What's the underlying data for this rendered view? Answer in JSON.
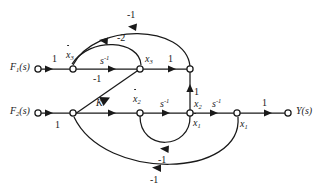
{
  "diagram": {
    "type": "signal-flow-graph",
    "stroke_color": "#1a1a1a",
    "background_color": "#ffffff",
    "inputs": [
      {
        "id": "f1",
        "label": "F",
        "subscript": "1",
        "suffix": "(s)"
      },
      {
        "id": "f2",
        "label": "F",
        "subscript": "2",
        "suffix": "(s)"
      }
    ],
    "output": {
      "id": "y",
      "label": "Y",
      "suffix": "(s)"
    },
    "node_labels": {
      "x3dot": {
        "base": "x",
        "sub": "3",
        "dot": true
      },
      "x3": {
        "base": "x",
        "sub": "3",
        "dot": false
      },
      "x2dot": {
        "base": "x",
        "sub": "2",
        "dot": true
      },
      "x2": {
        "base": "x",
        "sub": "2",
        "dot": false
      },
      "x1dot": {
        "base": "x",
        "sub": "1",
        "dot": true
      },
      "x1": {
        "base": "x",
        "sub": "1",
        "dot": false
      }
    },
    "edge_gains": {
      "f1_to_x3dot": "1",
      "x3dot_to_x3": "s",
      "x3dot_to_x3_exp": "-1",
      "x3_to_sum3": "1",
      "top_outer_feedback": "-1",
      "top_inner_feedback": "-2",
      "x3_to_sumK_diagonal": "-1",
      "f2_to_sumK": "1",
      "sumK_to_x2dot": "K",
      "x2dot_to_x2": "s",
      "x2dot_to_x2_exp": "-1",
      "x2_up_to_sum3": "1",
      "x2_to_x1": "s",
      "x2_to_x1_exp": "-1",
      "x1_to_y": "1",
      "inner_bottom_feedback": "-1",
      "outer_bottom_feedback": "-1"
    }
  }
}
